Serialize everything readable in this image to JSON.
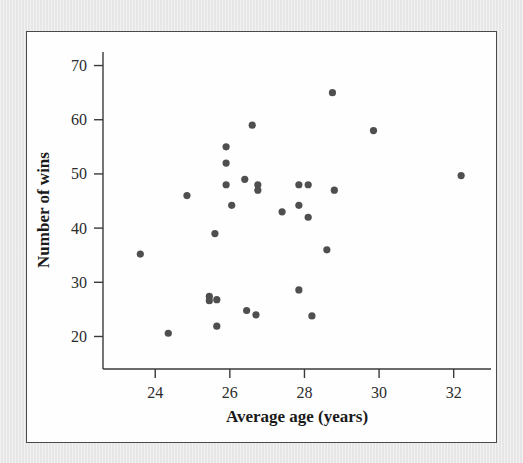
{
  "figure": {
    "background_color": "#e9e9e9",
    "panel_color": "#fefefe",
    "panel_border_color": "#4a4a4a",
    "marker_color": "#4f4f4f",
    "axis_color": "#3a3a3a"
  },
  "chart_data": {
    "type": "scatter",
    "title": "",
    "xlabel": "Average age (years)",
    "ylabel": "Number of wins",
    "xlim": [
      22.6,
      33.0
    ],
    "ylim": [
      14.0,
      72.5
    ],
    "xticks": [
      24,
      26,
      28,
      30,
      32
    ],
    "xtick_labels": [
      "24",
      "26",
      "28",
      "30",
      "32"
    ],
    "yticks": [
      20,
      30,
      40,
      50,
      60,
      70
    ],
    "ytick_labels": [
      "20",
      "30",
      "40",
      "50",
      "60",
      "70"
    ],
    "grid": false,
    "legend": false,
    "legend_position": "none",
    "marker": "circle",
    "points": [
      {
        "x": 23.6,
        "y": 35.2
      },
      {
        "x": 24.35,
        "y": 20.6
      },
      {
        "x": 24.85,
        "y": 46.0
      },
      {
        "x": 25.45,
        "y": 27.4
      },
      {
        "x": 25.45,
        "y": 26.6
      },
      {
        "x": 25.65,
        "y": 26.8
      },
      {
        "x": 25.65,
        "y": 21.9
      },
      {
        "x": 25.6,
        "y": 39.0
      },
      {
        "x": 25.9,
        "y": 55.0
      },
      {
        "x": 25.9,
        "y": 52.0
      },
      {
        "x": 25.9,
        "y": 48.0
      },
      {
        "x": 26.05,
        "y": 44.2
      },
      {
        "x": 26.4,
        "y": 49.0
      },
      {
        "x": 26.45,
        "y": 24.8
      },
      {
        "x": 26.6,
        "y": 59.0
      },
      {
        "x": 26.7,
        "y": 24.0
      },
      {
        "x": 26.75,
        "y": 48.0
      },
      {
        "x": 26.75,
        "y": 47.0
      },
      {
        "x": 27.4,
        "y": 43.0
      },
      {
        "x": 27.85,
        "y": 48.0
      },
      {
        "x": 27.85,
        "y": 44.2
      },
      {
        "x": 27.85,
        "y": 28.6
      },
      {
        "x": 28.1,
        "y": 48.0
      },
      {
        "x": 28.1,
        "y": 42.0
      },
      {
        "x": 28.2,
        "y": 23.8
      },
      {
        "x": 28.6,
        "y": 36.0
      },
      {
        "x": 28.75,
        "y": 65.0
      },
      {
        "x": 28.8,
        "y": 47.0
      },
      {
        "x": 29.85,
        "y": 58.0
      },
      {
        "x": 32.2,
        "y": 49.7
      }
    ]
  }
}
